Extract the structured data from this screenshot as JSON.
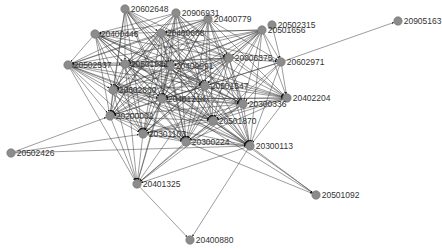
{
  "diagram": {
    "type": "directed-network-graph",
    "colors": {
      "node": "#8c8c8c",
      "edge": "#3a3a3a",
      "label": "#333333",
      "background": "#ffffff"
    },
    "nodes": [
      {
        "id": "20602648",
        "x": 125,
        "y": 9
      },
      {
        "id": "20906931",
        "x": 176,
        "y": 13
      },
      {
        "id": "20400779",
        "x": 208,
        "y": 19
      },
      {
        "id": "20502315",
        "x": 272,
        "y": 25
      },
      {
        "id": "20501656",
        "x": 262,
        "y": 30
      },
      {
        "id": "20905163",
        "x": 398,
        "y": 21
      },
      {
        "id": "20400446",
        "x": 95,
        "y": 34
      },
      {
        "id": "20400668",
        "x": 161,
        "y": 33
      },
      {
        "id": "20006375",
        "x": 229,
        "y": 58
      },
      {
        "id": "20602971",
        "x": 281,
        "y": 62
      },
      {
        "id": "20502537",
        "x": 68,
        "y": 65
      },
      {
        "id": "20501981",
        "x": 125,
        "y": 64
      },
      {
        "id": "20400991",
        "x": 170,
        "y": 66
      },
      {
        "id": "20501547",
        "x": 205,
        "y": 86
      },
      {
        "id": "20602860",
        "x": 113,
        "y": 90
      },
      {
        "id": "20401214",
        "x": 162,
        "y": 99
      },
      {
        "id": "20402204",
        "x": 287,
        "y": 98
      },
      {
        "id": "20300336",
        "x": 243,
        "y": 104
      },
      {
        "id": "20200002",
        "x": 110,
        "y": 116
      },
      {
        "id": "20501870",
        "x": 213,
        "y": 121
      },
      {
        "id": "20301103",
        "x": 143,
        "y": 134
      },
      {
        "id": "20300224",
        "x": 186,
        "y": 142
      },
      {
        "id": "20300113",
        "x": 250,
        "y": 146
      },
      {
        "id": "20502426",
        "x": 11,
        "y": 153
      },
      {
        "id": "20401325",
        "x": 137,
        "y": 184
      },
      {
        "id": "20501092",
        "x": 316,
        "y": 195
      },
      {
        "id": "20400880",
        "x": 190,
        "y": 240
      }
    ],
    "edges": [
      [
        "20602971",
        "20905163"
      ],
      [
        "20502315",
        "20602971"
      ],
      [
        "20502426",
        "20200002"
      ],
      [
        "20502426",
        "20301103"
      ],
      [
        "20502426",
        "20300113"
      ],
      [
        "20401325",
        "20400880"
      ],
      [
        "20300113",
        "20400880"
      ],
      [
        "20300113",
        "20501092"
      ],
      [
        "20401214",
        "20501092"
      ],
      [
        "20501870",
        "20501092"
      ],
      [
        "20300224",
        "20501092"
      ],
      [
        "20602648",
        "20400668"
      ],
      [
        "20602648",
        "20501981"
      ],
      [
        "20602648",
        "20400991"
      ],
      [
        "20602648",
        "20006375"
      ],
      [
        "20602648",
        "20501547"
      ],
      [
        "20602648",
        "20401214"
      ],
      [
        "20602648",
        "20300336"
      ],
      [
        "20602648",
        "20200002"
      ],
      [
        "20602648",
        "20301103"
      ],
      [
        "20602648",
        "20300224"
      ],
      [
        "20602648",
        "20300113"
      ],
      [
        "20602648",
        "20602860"
      ],
      [
        "20602648",
        "20501870"
      ],
      [
        "20906931",
        "20400446"
      ],
      [
        "20906931",
        "20501981"
      ],
      [
        "20906931",
        "20400991"
      ],
      [
        "20906931",
        "20006375"
      ],
      [
        "20906931",
        "20501547"
      ],
      [
        "20906931",
        "20602860"
      ],
      [
        "20906931",
        "20401214"
      ],
      [
        "20906931",
        "20300336"
      ],
      [
        "20906931",
        "20200002"
      ],
      [
        "20906931",
        "20301103"
      ],
      [
        "20906931",
        "20300224"
      ],
      [
        "20906931",
        "20501870"
      ],
      [
        "20906931",
        "20300113"
      ],
      [
        "20906931",
        "20402204"
      ],
      [
        "20906931",
        "20502537"
      ],
      [
        "20400779",
        "20400446"
      ],
      [
        "20400779",
        "20400668"
      ],
      [
        "20400779",
        "20501981"
      ],
      [
        "20400779",
        "20400991"
      ],
      [
        "20400779",
        "20006375"
      ],
      [
        "20400779",
        "20501547"
      ],
      [
        "20400779",
        "20602860"
      ],
      [
        "20400779",
        "20401214"
      ],
      [
        "20400779",
        "20300336"
      ],
      [
        "20400779",
        "20200002"
      ],
      [
        "20400779",
        "20301103"
      ],
      [
        "20400779",
        "20300224"
      ],
      [
        "20400779",
        "20501870"
      ],
      [
        "20400779",
        "20300113"
      ],
      [
        "20400779",
        "20402204"
      ],
      [
        "20400779",
        "20602971"
      ],
      [
        "20400779",
        "20502537"
      ],
      [
        "20501656",
        "20400446"
      ],
      [
        "20501656",
        "20400668"
      ],
      [
        "20501656",
        "20501981"
      ],
      [
        "20501656",
        "20400991"
      ],
      [
        "20501656",
        "20006375"
      ],
      [
        "20501656",
        "20501547"
      ],
      [
        "20501656",
        "20602860"
      ],
      [
        "20501656",
        "20401214"
      ],
      [
        "20501656",
        "20300336"
      ],
      [
        "20501656",
        "20200002"
      ],
      [
        "20501656",
        "20301103"
      ],
      [
        "20501656",
        "20300224"
      ],
      [
        "20501656",
        "20501870"
      ],
      [
        "20501656",
        "20300113"
      ],
      [
        "20501656",
        "20402204"
      ],
      [
        "20501656",
        "20602971"
      ],
      [
        "20501656",
        "20502537"
      ],
      [
        "20400446",
        "20501981"
      ],
      [
        "20400446",
        "20400991"
      ],
      [
        "20400446",
        "20006375"
      ],
      [
        "20400446",
        "20501547"
      ],
      [
        "20400446",
        "20602860"
      ],
      [
        "20400446",
        "20401214"
      ],
      [
        "20400446",
        "20300336"
      ],
      [
        "20400446",
        "20200002"
      ],
      [
        "20400446",
        "20301103"
      ],
      [
        "20400446",
        "20300224"
      ],
      [
        "20400446",
        "20501870"
      ],
      [
        "20400446",
        "20300113"
      ],
      [
        "20400446",
        "20402204"
      ],
      [
        "20400446",
        "20502537"
      ],
      [
        "20400668",
        "20501981"
      ],
      [
        "20400668",
        "20400991"
      ],
      [
        "20400668",
        "20006375"
      ],
      [
        "20400668",
        "20501547"
      ],
      [
        "20400668",
        "20602860"
      ],
      [
        "20400668",
        "20401214"
      ],
      [
        "20400668",
        "20300336"
      ],
      [
        "20400668",
        "20200002"
      ],
      [
        "20400668",
        "20301103"
      ],
      [
        "20400668",
        "20300224"
      ],
      [
        "20400668",
        "20501870"
      ],
      [
        "20400668",
        "20300113"
      ],
      [
        "20400668",
        "20402204"
      ],
      [
        "20400668",
        "20502537"
      ],
      [
        "20400668",
        "20602971"
      ],
      [
        "20006375",
        "20501981"
      ],
      [
        "20006375",
        "20400991"
      ],
      [
        "20006375",
        "20501547"
      ],
      [
        "20006375",
        "20602860"
      ],
      [
        "20006375",
        "20401214"
      ],
      [
        "20006375",
        "20300336"
      ],
      [
        "20006375",
        "20200002"
      ],
      [
        "20006375",
        "20301103"
      ],
      [
        "20006375",
        "20300224"
      ],
      [
        "20006375",
        "20501870"
      ],
      [
        "20006375",
        "20300113"
      ],
      [
        "20006375",
        "20402204"
      ],
      [
        "20006375",
        "20502537"
      ],
      [
        "20006375",
        "20602971"
      ],
      [
        "20502537",
        "20501981"
      ],
      [
        "20502537",
        "20400991"
      ],
      [
        "20502537",
        "20501547"
      ],
      [
        "20502537",
        "20602860"
      ],
      [
        "20502537",
        "20401214"
      ],
      [
        "20502537",
        "20300336"
      ],
      [
        "20502537",
        "20200002"
      ],
      [
        "20502537",
        "20301103"
      ],
      [
        "20502537",
        "20300224"
      ],
      [
        "20502537",
        "20501870"
      ],
      [
        "20502537",
        "20300113"
      ],
      [
        "20502537",
        "20401325"
      ],
      [
        "20501981",
        "20400991"
      ],
      [
        "20501981",
        "20501547"
      ],
      [
        "20501981",
        "20602860"
      ],
      [
        "20501981",
        "20401214"
      ],
      [
        "20501981",
        "20300336"
      ],
      [
        "20501981",
        "20200002"
      ],
      [
        "20501981",
        "20301103"
      ],
      [
        "20501981",
        "20300224"
      ],
      [
        "20501981",
        "20501870"
      ],
      [
        "20501981",
        "20300113"
      ],
      [
        "20501981",
        "20402204"
      ],
      [
        "20501981",
        "20401325"
      ],
      [
        "20400991",
        "20501547"
      ],
      [
        "20400991",
        "20602860"
      ],
      [
        "20400991",
        "20401214"
      ],
      [
        "20400991",
        "20300336"
      ],
      [
        "20400991",
        "20200002"
      ],
      [
        "20400991",
        "20301103"
      ],
      [
        "20400991",
        "20300224"
      ],
      [
        "20400991",
        "20501870"
      ],
      [
        "20400991",
        "20300113"
      ],
      [
        "20400991",
        "20402204"
      ],
      [
        "20400991",
        "20401325"
      ],
      [
        "20501547",
        "20602860"
      ],
      [
        "20501547",
        "20401214"
      ],
      [
        "20501547",
        "20300336"
      ],
      [
        "20501547",
        "20200002"
      ],
      [
        "20501547",
        "20301103"
      ],
      [
        "20501547",
        "20300224"
      ],
      [
        "20501547",
        "20501870"
      ],
      [
        "20501547",
        "20300113"
      ],
      [
        "20501547",
        "20402204"
      ],
      [
        "20501547",
        "20401325"
      ],
      [
        "20602860",
        "20401214"
      ],
      [
        "20602860",
        "20300336"
      ],
      [
        "20602860",
        "20200002"
      ],
      [
        "20602860",
        "20301103"
      ],
      [
        "20602860",
        "20300224"
      ],
      [
        "20602860",
        "20501870"
      ],
      [
        "20602860",
        "20300113"
      ],
      [
        "20602860",
        "20401325"
      ],
      [
        "20401214",
        "20300336"
      ],
      [
        "20401214",
        "20200002"
      ],
      [
        "20401214",
        "20301103"
      ],
      [
        "20401214",
        "20300224"
      ],
      [
        "20401214",
        "20501870"
      ],
      [
        "20401214",
        "20300113"
      ],
      [
        "20401214",
        "20402204"
      ],
      [
        "20401214",
        "20401325"
      ],
      [
        "20602971",
        "20300336"
      ],
      [
        "20602971",
        "20501870"
      ],
      [
        "20602971",
        "20300113"
      ],
      [
        "20602971",
        "20402204"
      ],
      [
        "20602971",
        "20501547"
      ],
      [
        "20602971",
        "20401214"
      ],
      [
        "20402204",
        "20300336"
      ],
      [
        "20402204",
        "20501870"
      ],
      [
        "20402204",
        "20300113"
      ],
      [
        "20402204",
        "20300224"
      ],
      [
        "20402204",
        "20301103"
      ],
      [
        "20402204",
        "20401214"
      ],
      [
        "20300336",
        "20200002"
      ],
      [
        "20300336",
        "20301103"
      ],
      [
        "20300336",
        "20300224"
      ],
      [
        "20300336",
        "20501870"
      ],
      [
        "20300336",
        "20300113"
      ],
      [
        "20300336",
        "20401325"
      ],
      [
        "20200002",
        "20301103"
      ],
      [
        "20200002",
        "20300224"
      ],
      [
        "20200002",
        "20501870"
      ],
      [
        "20200002",
        "20300113"
      ],
      [
        "20200002",
        "20401325"
      ],
      [
        "20501870",
        "20301103"
      ],
      [
        "20501870",
        "20300224"
      ],
      [
        "20501870",
        "20300113"
      ],
      [
        "20501870",
        "20401325"
      ],
      [
        "20301103",
        "20300224"
      ],
      [
        "20301103",
        "20300113"
      ],
      [
        "20301103",
        "20401325"
      ],
      [
        "20300224",
        "20300113"
      ],
      [
        "20300224",
        "20401325"
      ],
      [
        "20300113",
        "20401325"
      ]
    ]
  }
}
